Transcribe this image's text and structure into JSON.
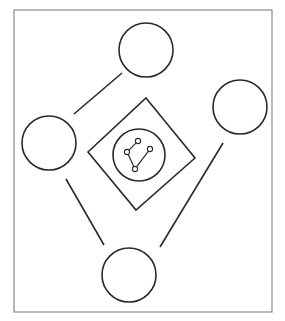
{
  "diagram": {
    "frame": {
      "x": 14,
      "y": 10,
      "width": 258,
      "height": 302,
      "stroke": "#8a8a8a"
    },
    "stroke_color": "#2a2a2a",
    "outer_circles": [
      {
        "id": "top",
        "cx": 146,
        "cy": 50,
        "r": 27
      },
      {
        "id": "left",
        "cx": 49,
        "cy": 143,
        "r": 27
      },
      {
        "id": "right",
        "cx": 240,
        "cy": 107,
        "r": 27
      },
      {
        "id": "bottom",
        "cx": 129,
        "cy": 275,
        "r": 27
      }
    ],
    "connector_lines": [
      {
        "id": "top-left",
        "x1": 122,
        "y1": 73,
        "x2": 74,
        "y2": 114
      },
      {
        "id": "left-bottom",
        "x1": 66,
        "y1": 179,
        "x2": 104,
        "y2": 245
      },
      {
        "id": "right-bottom",
        "x1": 223,
        "y1": 143,
        "x2": 160,
        "y2": 247
      }
    ],
    "center_diamond": {
      "points": [
        [
          146,
          98
        ],
        [
          195,
          158
        ],
        [
          136,
          210
        ],
        [
          88,
          152
        ]
      ]
    },
    "inner_circle": {
      "cx": 139,
      "cy": 155,
      "r": 26
    },
    "small_nodes": [
      {
        "id": "n1",
        "cx": 127,
        "cy": 152,
        "r": 2.6
      },
      {
        "id": "n2",
        "cx": 138,
        "cy": 141,
        "r": 2.6
      },
      {
        "id": "n3",
        "cx": 150,
        "cy": 149,
        "r": 2.6
      },
      {
        "id": "n4",
        "cx": 135,
        "cy": 169,
        "r": 2.6
      }
    ],
    "small_edges": [
      [
        "n1",
        "n2"
      ],
      [
        "n1",
        "n4"
      ],
      [
        "n4",
        "n3"
      ]
    ]
  }
}
